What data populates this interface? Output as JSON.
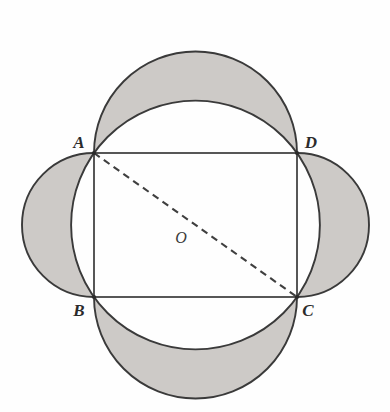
{
  "figure": {
    "background_color": "#fefefe",
    "shade_color": "#cdcac7",
    "stroke_color": "#3a3a3a",
    "dash_color": "#3f3f3f",
    "labels": {
      "a": "A",
      "b": "B",
      "c": "C",
      "d": "D",
      "o": "O"
    },
    "points": {
      "A": {
        "x": 94,
        "y": 153
      },
      "B": {
        "x": 94,
        "y": 297
      },
      "C": {
        "x": 297,
        "y": 297
      },
      "D": {
        "x": 297,
        "y": 153
      },
      "O": {
        "x": 195.5,
        "y": 225
      }
    },
    "label_positions": {
      "A": {
        "x": 79,
        "y": 148
      },
      "B": {
        "x": 79,
        "y": 316
      },
      "C": {
        "x": 303,
        "y": 316
      },
      "D": {
        "x": 303,
        "y": 148
      },
      "O": {
        "x": 176,
        "y": 243
      }
    },
    "rectangle": {
      "x": 94,
      "y": 153,
      "width": 203,
      "height": 144
    },
    "circle": {
      "cx": 195.5,
      "cy": 225,
      "r": 124.4
    },
    "semicircles": [
      {
        "name": "top-semicircle-on-AD",
        "cx": 195.5,
        "cy": 153,
        "r": 101.5,
        "direction": "up"
      },
      {
        "name": "bottom-semicircle-on-BC",
        "cx": 195.5,
        "cy": 297,
        "r": 101.5,
        "direction": "down"
      },
      {
        "name": "left-semicircle-on-AB",
        "cx": 94,
        "cy": 225,
        "r": 72,
        "direction": "left"
      },
      {
        "name": "right-semicircle-on-DC",
        "cx": 297,
        "cy": 225,
        "r": 72,
        "direction": "right"
      }
    ],
    "diagonal": {
      "name": "dashed-diagonal-AC",
      "from": "A",
      "to": "C",
      "style": "dashed",
      "dash_pattern": "7 5"
    }
  }
}
